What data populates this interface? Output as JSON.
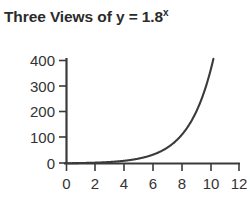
{
  "chart_data": {
    "type": "line",
    "title": "Three Views of y = 1.8x",
    "title_base": "Three Views of y = 1.8",
    "title_exponent": "x",
    "function": "y = 1.8^x",
    "base": 1.8,
    "xlabel": "",
    "ylabel": "",
    "xlim": [
      0,
      12
    ],
    "ylim": [
      0,
      440
    ],
    "grid": false,
    "legend": false,
    "x_ticks": [
      0,
      2,
      4,
      6,
      8,
      10,
      12
    ],
    "x_tick_labels": [
      "0",
      "2",
      "4",
      "6",
      "8",
      "10",
      "12"
    ],
    "y_ticks": [
      0,
      100,
      200,
      300,
      400
    ],
    "y_tick_labels": [
      "0",
      "100",
      "200",
      "300",
      "400"
    ],
    "x": [
      0,
      0.5,
      1,
      1.5,
      2,
      2.5,
      3,
      3.5,
      4,
      4.5,
      5,
      5.5,
      6,
      6.5,
      7,
      7.5,
      8,
      8.5,
      9,
      9.5,
      10,
      10.3,
      10.5
    ],
    "y": [
      1,
      1.34,
      1.8,
      2.42,
      3.24,
      4.35,
      5.83,
      7.82,
      10.5,
      14.1,
      18.9,
      25.3,
      34,
      45.6,
      61.2,
      82,
      110,
      147.6,
      198,
      265.6,
      356.3,
      420.9,
      466
    ],
    "series": [
      {
        "name": "y = 1.8^x",
        "color": "#3a3a3a",
        "values": [
          1,
          1.34,
          1.8,
          2.42,
          3.24,
          4.35,
          5.83,
          7.82,
          10.5,
          14.1,
          18.9,
          25.3,
          34,
          45.6,
          61.2,
          82,
          110,
          147.6,
          198,
          265.6,
          356.3,
          420.9,
          466
        ]
      }
    ],
    "axis_color": "#3a3a3a",
    "curve_color": "#3a3a3a",
    "title_color": "#2b2b2b",
    "background_color": "#ffffff"
  }
}
